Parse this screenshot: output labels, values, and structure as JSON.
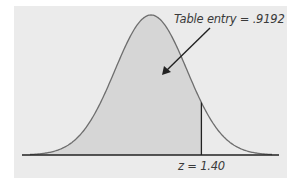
{
  "chart_data": {
    "type": "area",
    "title": "",
    "distribution": "standard normal",
    "shaded_region": "left of z",
    "z_value": 1.4,
    "table_entry": 0.9192,
    "annotations": [
      "Table entry = .9192",
      "z = 1.40"
    ],
    "xlabel": "",
    "ylabel": "",
    "grid": false,
    "legend": null
  },
  "labels": {
    "table_entry": "Table entry = .9192",
    "z_label": "z = 1.40"
  },
  "colors": {
    "background": "#ebebeb",
    "shaded": "#d6d6d6",
    "curve": "#6e6e6e",
    "axis": "#222222"
  }
}
